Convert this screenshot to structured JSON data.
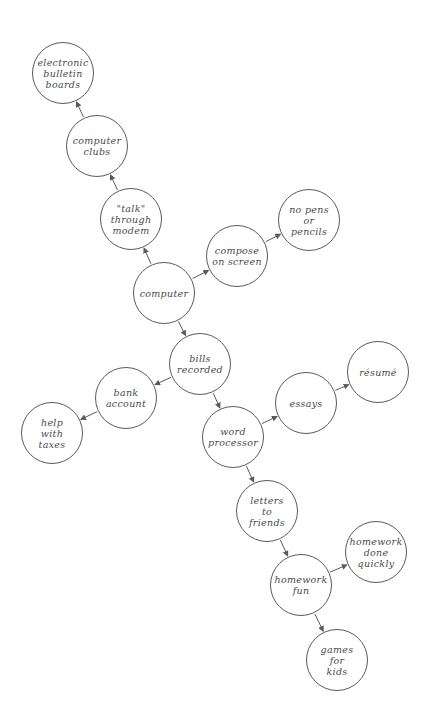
{
  "diagram": {
    "type": "concept-map",
    "stroke_color": "#5a5a5a",
    "text_color": "#4a4a4a",
    "nodes": [
      {
        "id": "bulletin",
        "label": "electronic\nbulletin\nboards",
        "x": 63,
        "y": 73
      },
      {
        "id": "clubs",
        "label": "computer\nclubs",
        "x": 97,
        "y": 146
      },
      {
        "id": "modem",
        "label": "\"talk\"\nthrough\nmodem",
        "x": 131,
        "y": 219
      },
      {
        "id": "compose",
        "label": "compose\non screen",
        "x": 237,
        "y": 256
      },
      {
        "id": "nopens",
        "label": "no pens\nor\npencils",
        "x": 309,
        "y": 220
      },
      {
        "id": "computer",
        "label": "computer",
        "x": 164,
        "y": 293
      },
      {
        "id": "bills",
        "label": "bills\nrecorded",
        "x": 200,
        "y": 364
      },
      {
        "id": "bank",
        "label": "bank\naccount",
        "x": 126,
        "y": 398
      },
      {
        "id": "taxes",
        "label": "help\nwith\ntaxes",
        "x": 52,
        "y": 433
      },
      {
        "id": "word",
        "label": "word\nprocessor",
        "x": 233,
        "y": 437
      },
      {
        "id": "essays",
        "label": "essays",
        "x": 306,
        "y": 403
      },
      {
        "id": "resume",
        "label": "résumé",
        "x": 378,
        "y": 372
      },
      {
        "id": "letters",
        "label": "letters\nto\nfriends",
        "x": 267,
        "y": 511
      },
      {
        "id": "hwfun",
        "label": "homework\nfun",
        "x": 301,
        "y": 585
      },
      {
        "id": "hwquick",
        "label": "homework\ndone\nquickly",
        "x": 376,
        "y": 552
      },
      {
        "id": "games",
        "label": "games\nfor\nkids",
        "x": 337,
        "y": 660
      }
    ],
    "edges": [
      {
        "from": "computer",
        "to": "modem"
      },
      {
        "from": "modem",
        "to": "clubs"
      },
      {
        "from": "clubs",
        "to": "bulletin"
      },
      {
        "from": "computer",
        "to": "compose"
      },
      {
        "from": "compose",
        "to": "nopens"
      },
      {
        "from": "computer",
        "to": "bills"
      },
      {
        "from": "bills",
        "to": "bank"
      },
      {
        "from": "bank",
        "to": "taxes"
      },
      {
        "from": "bills",
        "to": "word"
      },
      {
        "from": "word",
        "to": "essays"
      },
      {
        "from": "essays",
        "to": "resume"
      },
      {
        "from": "word",
        "to": "letters"
      },
      {
        "from": "letters",
        "to": "hwfun"
      },
      {
        "from": "hwfun",
        "to": "hwquick"
      },
      {
        "from": "hwfun",
        "to": "games"
      }
    ]
  }
}
